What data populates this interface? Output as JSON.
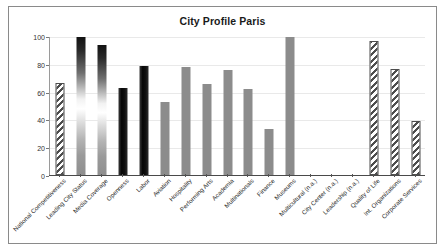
{
  "chart_data": {
    "type": "bar",
    "title": "City Profile Paris",
    "xlabel": "",
    "ylabel": "",
    "ylim": [
      0,
      100
    ],
    "yticks": [
      0,
      20,
      40,
      60,
      80,
      100
    ],
    "grid": true,
    "legend": "none",
    "categories": [
      "National Competitiveness",
      "Leading City Status",
      "Media Coverage",
      "Openness",
      "Labor",
      "Aviation",
      "Hospitality",
      "Performing Arts",
      "Academia",
      "Multinationals",
      "Finance",
      "Museums",
      "Multicultural (n.a.)",
      "City Center (n.a.)",
      "Leadership (n.a.)",
      "Quality of Life",
      "Int. Organizations",
      "Corporate Services"
    ],
    "values": [
      67,
      100,
      94,
      63,
      79,
      53,
      78,
      66,
      76,
      62,
      33,
      100,
      0,
      0,
      0,
      97,
      77,
      39
    ],
    "bar_styles": [
      "hatch",
      "gradient",
      "gradient",
      "solid-black",
      "solid-black",
      "solid-gray",
      "solid-gray",
      "solid-gray",
      "solid-gray",
      "solid-gray",
      "solid-gray",
      "solid-gray",
      "none",
      "none",
      "none",
      "hatch",
      "hatch",
      "hatch"
    ],
    "colors": {
      "gray": "#8c8c8c",
      "black": "#0d0d0d",
      "hatch": "#4d4d4d",
      "grid": "#e9e9e9",
      "axis": "#4a4a4a",
      "border": "#8a8a8a",
      "text": "#1a1a1a"
    }
  }
}
